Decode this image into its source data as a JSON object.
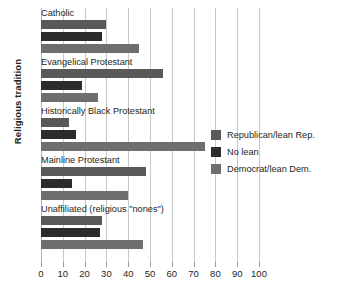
{
  "chart_data": {
    "type": "bar",
    "orientation": "horizontal",
    "title": "",
    "xlabel": "",
    "ylabel": "Religious tradition",
    "xlim": [
      0,
      100
    ],
    "xticks": [
      0,
      10,
      20,
      30,
      40,
      50,
      60,
      70,
      80,
      90,
      100
    ],
    "grid": true,
    "legend_position": "right",
    "categories": [
      "Catholic",
      "Evangelical Protestant",
      "Historically Black Protestant",
      "Mainline Protestant",
      "Unaffiliated (religious \"nones\")"
    ],
    "series": [
      {
        "name": "Republican/lean Rep.",
        "color": "#595959",
        "values": [
          30,
          56,
          13,
          48,
          28
        ]
      },
      {
        "name": "No lean",
        "color": "#2b2b2b",
        "values": [
          28,
          19,
          16,
          14,
          27
        ]
      },
      {
        "name": "Democrat/lean Dem.",
        "color": "#6e6e6e",
        "values": [
          45,
          26,
          75,
          40,
          47
        ]
      }
    ]
  },
  "axis": {
    "y_title": "Religious tradition",
    "x_tick_labels": [
      "0",
      "10",
      "20",
      "30",
      "40",
      "50",
      "60",
      "70",
      "80",
      "90",
      "100"
    ]
  },
  "legend": {
    "items": [
      {
        "label": "Republican/lean Rep.",
        "key": "rep"
      },
      {
        "label": "No lean",
        "key": "none"
      },
      {
        "label": "Democrat/lean Dem.",
        "key": "dem"
      }
    ]
  }
}
